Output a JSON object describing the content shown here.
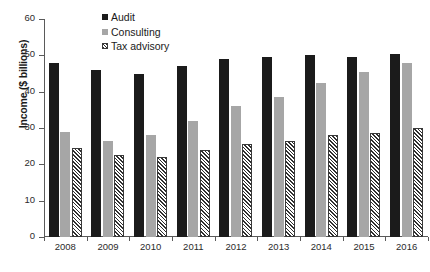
{
  "chart_data": {
    "type": "bar",
    "title": "",
    "subtitle": "",
    "xlabel": "",
    "ylabel": "Income ($ billions)",
    "categories": [
      "2008",
      "2009",
      "2010",
      "2011",
      "2012",
      "2013",
      "2014",
      "2015",
      "2016"
    ],
    "series": [
      {
        "name": "Audit",
        "values": [
          48,
          46,
          45,
          47,
          49,
          49.5,
          50,
          49.5,
          50.5
        ]
      },
      {
        "name": "Consulting",
        "values": [
          29,
          26.5,
          28,
          32,
          36,
          38.5,
          42.5,
          45.5,
          48
        ]
      },
      {
        "name": "Tax advisory",
        "values": [
          24.5,
          22.5,
          22,
          24,
          25.5,
          26.5,
          28,
          28.5,
          30
        ]
      }
    ],
    "ylim": [
      0,
      60
    ],
    "yticks": [
      0,
      10,
      20,
      30,
      40,
      50,
      60
    ],
    "grid": false,
    "legend_position": "top-center",
    "colors": {
      "audit": "#1b1b1b",
      "consulting": "#a6a6a6",
      "tax_advisory": "#2f2f2f",
      "axis": "#5a5a5a",
      "background": "#ffffff"
    }
  },
  "legend": {
    "items": [
      {
        "label": "Audit"
      },
      {
        "label": "Consulting"
      },
      {
        "label": "Tax advisory"
      }
    ]
  }
}
